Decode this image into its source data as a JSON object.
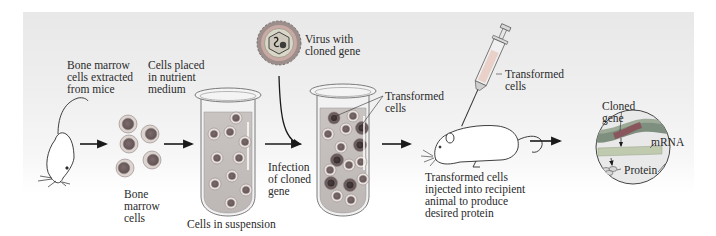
{
  "diagram": {
    "type": "process-flow",
    "colors": {
      "panel_top": "#e8e8e8",
      "panel_bottom": "#ffffff",
      "cell_outer": "#d8d0cc",
      "cell_nucleus": "#8a7a7a",
      "transformed_nucleus": "#4e4244",
      "medium": "#b9b5b3",
      "gene_strand": "#6d7b6f",
      "gene_highlight": "#a15a63",
      "mrna": "#b8c4aa",
      "arrow": "#1a1a1a"
    },
    "steps": [
      {
        "id": "mouse-donor",
        "label": "Bone marrow\ncells extracted\nfrom mice"
      },
      {
        "id": "bone-marrow-cells",
        "label": "Bone\nmarrow\ncells",
        "top_label": "Cells placed\nin nutrient\nmedium"
      },
      {
        "id": "cells-in-suspension",
        "label": "Cells in suspension"
      },
      {
        "id": "infection",
        "label": "Infection\nof cloned\ngene"
      },
      {
        "id": "virus",
        "label": "Virus with\ncloned gene"
      },
      {
        "id": "transformed-tube",
        "label": "Transformed\ncells"
      },
      {
        "id": "recipient-mouse",
        "label": "Transformed cells\ninjected into recipient\nanimal to produce\ndesired protein"
      },
      {
        "id": "syringe",
        "label": "Transformed\ncells"
      },
      {
        "id": "gene-expression",
        "labels": {
          "gene": "Cloned\ngene",
          "mrna": "mRNA",
          "protein": "Protein"
        }
      }
    ]
  }
}
